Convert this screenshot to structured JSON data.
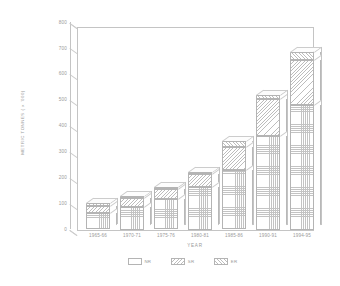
{
  "chart_data": {
    "type": "bar",
    "stacked": true,
    "title": "",
    "xlabel": "YEAR",
    "ylabel": "METRIC TONNES ( x '000)",
    "categories": [
      "1965-66",
      "1970-71",
      "1975-76",
      "1980-81",
      "1985-86",
      "1990-91",
      "1994-95"
    ],
    "ylim": [
      0,
      800
    ],
    "yticks": [
      0,
      100,
      200,
      300,
      400,
      500,
      600,
      700,
      800
    ],
    "grid": false,
    "legend_position": "bottom",
    "series": [
      {
        "name": "NR",
        "values": [
          62,
          85,
          118,
          165,
          228,
          360,
          480
        ]
      },
      {
        "name": "SR",
        "values": [
          28,
          35,
          38,
          48,
          92,
          145,
          175
        ]
      },
      {
        "name": "ER",
        "values": [
          12,
          8,
          9,
          8,
          20,
          15,
          30
        ]
      }
    ],
    "totals": [
      102,
      128,
      165,
      221,
      340,
      520,
      685
    ]
  },
  "axis": {
    "y_ticks": [
      "800",
      "700",
      "600",
      "500",
      "400",
      "300",
      "200",
      "100",
      "0"
    ],
    "x_title": "YEAR",
    "y_title": "METRIC TONNES ( x '000)"
  },
  "legend": {
    "items": [
      {
        "label": "NR",
        "pattern": "checker"
      },
      {
        "label": "SR",
        "pattern": "diag-back"
      },
      {
        "label": "ER",
        "pattern": "diag-fwd"
      }
    ]
  },
  "colors": {
    "axis": "#c4c4c4",
    "text": "#9a9a9a",
    "hatch": "#c0c0c0",
    "background": "#ffffff"
  }
}
